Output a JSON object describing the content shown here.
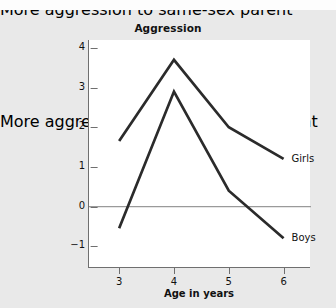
{
  "chart_data": {
    "type": "line",
    "title": "Aggression",
    "xlabel": "Age in years",
    "ylabel_upper": "More aggression\nto same-sex\nparent",
    "ylabel_lower": "More aggression\nto opposite-sex\nparent",
    "x": [
      3,
      4,
      5,
      6
    ],
    "xticklabels": [
      "3",
      "4",
      "5",
      "6"
    ],
    "yticks": [
      4,
      3,
      2,
      1,
      0,
      -1
    ],
    "yticklabels": [
      "4",
      "3",
      "2",
      "1",
      "0",
      "−1"
    ],
    "xlim": [
      2.45,
      6.5
    ],
    "ylim": [
      -1.55,
      4.2
    ],
    "grid": false,
    "zero_line": true,
    "legend_position": "inline-right",
    "series": [
      {
        "name": "Girls",
        "label": "Girls",
        "color": "#2b2b2b",
        "values": [
          1.65,
          3.7,
          2.0,
          1.2
        ]
      },
      {
        "name": "Boys",
        "label": "Boys",
        "color": "#2b2b2b",
        "values": [
          -0.55,
          2.9,
          0.4,
          -0.8
        ]
      }
    ]
  },
  "figure": {
    "background_color": "#e9e9e9",
    "plot_background_color": "#ffffff",
    "axis_color": "#6f6f6f",
    "zero_line_color": "#9a9a9a"
  }
}
